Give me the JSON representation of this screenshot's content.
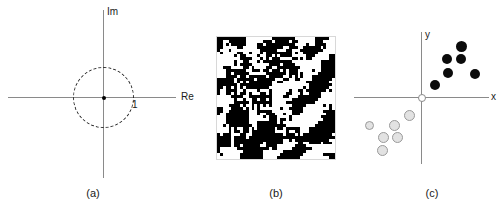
{
  "figure": {
    "panels": [
      {
        "id": "a",
        "caption": "(a)",
        "type": "complex-plane",
        "axes": {
          "vertical_label": "Im",
          "horizontal_label": "Re"
        },
        "unit_circle": {
          "style": "dashed",
          "radius_label": "1",
          "center_marker": "filled-dot"
        }
      },
      {
        "id": "b",
        "caption": "(b)",
        "type": "binary-texture-image",
        "description": "pixelated black and white diagonal stripe texture"
      },
      {
        "id": "c",
        "caption": "(c)",
        "type": "scatter",
        "axes": {
          "vertical_label": "y",
          "horizontal_label": "x"
        },
        "origin_marker": "open-circle"
      }
    ]
  },
  "chart_data": [
    {
      "type": "scatter",
      "title": "",
      "xlabel": "Re",
      "ylabel": "Im",
      "panel": "a",
      "annotations": [
        "1"
      ],
      "series": [
        {
          "name": "origin",
          "points": [
            [
              0,
              0
            ]
          ]
        }
      ],
      "unit_circle_radius": 1,
      "grid": false,
      "legend": "none"
    },
    {
      "type": "heatmap",
      "panel": "b",
      "title": "",
      "xlabel": "",
      "ylabel": "",
      "grid": false,
      "legend": "none",
      "colors": [
        "#ffffff",
        "#000000"
      ],
      "note": "binary diagonal stripe texture, 40x41 pixel blocks"
    },
    {
      "type": "scatter",
      "panel": "c",
      "title": "",
      "xlabel": "x",
      "ylabel": "y",
      "grid": false,
      "legend": "none",
      "xlim": [
        -5,
        5
      ],
      "ylim": [
        -4,
        4
      ],
      "series": [
        {
          "name": "class-1-dark",
          "color": "#0b0b0b",
          "points": [
            [
              2.6,
              3.3
            ],
            [
              1.8,
              2.5
            ],
            [
              2.6,
              2.5
            ],
            [
              1.9,
              1.6
            ],
            [
              3.5,
              1.6
            ],
            [
              1.0,
              0.8
            ]
          ]
        },
        {
          "name": "class-2-light",
          "color": "#e2e2e2",
          "points": [
            [
              -0.8,
              -0.9
            ],
            [
              -3.2,
              -1.6
            ],
            [
              -1.8,
              -1.6
            ],
            [
              -2.5,
              -2.3
            ],
            [
              -1.7,
              -2.3
            ],
            [
              -2.6,
              -3.1
            ]
          ]
        }
      ]
    }
  ],
  "colors": {
    "axis": "#8a8a8a",
    "text": "#1a1a1a",
    "dark_dot": "#0b0b0b",
    "light_dot": "#e2e2e2",
    "light_dot_border": "#9a9a9a",
    "circle_dash": "#2a2a2a",
    "background": "#ffffff"
  }
}
